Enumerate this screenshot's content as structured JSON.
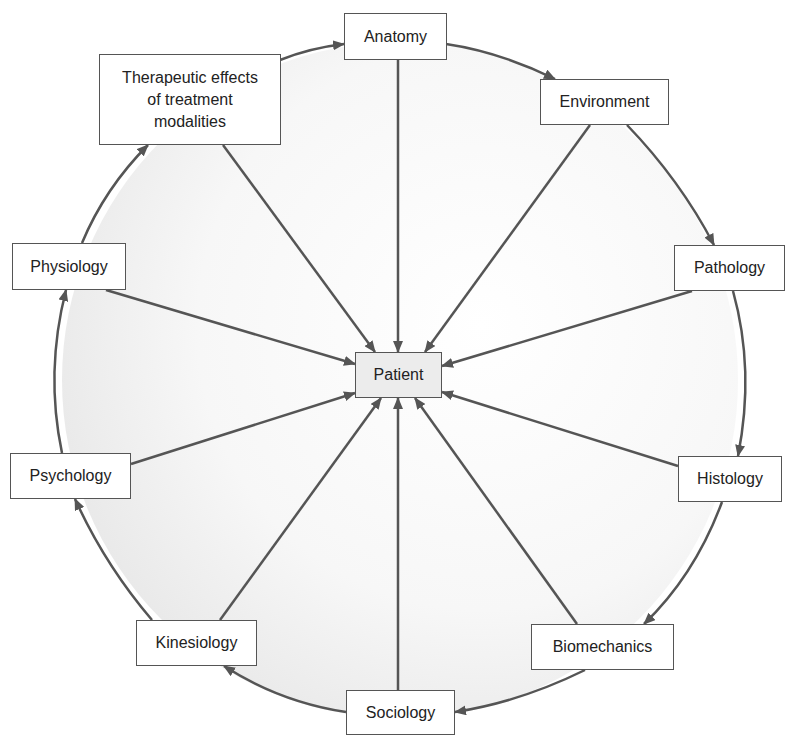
{
  "diagram": {
    "center": {
      "label": "Patient",
      "x": 355,
      "y": 352,
      "w": 87,
      "h": 46
    },
    "nodes": [
      {
        "id": "anatomy",
        "label": "Anatomy",
        "x": 344,
        "y": 13,
        "w": 103,
        "h": 47
      },
      {
        "id": "environment",
        "label": "Environment",
        "x": 540,
        "y": 79,
        "w": 129,
        "h": 46
      },
      {
        "id": "pathology",
        "label": "Pathology",
        "x": 674,
        "y": 245,
        "w": 111,
        "h": 46
      },
      {
        "id": "histology",
        "label": "Histology",
        "x": 678,
        "y": 456,
        "w": 104,
        "h": 46
      },
      {
        "id": "biomechanics",
        "label": "Biomechanics",
        "x": 531,
        "y": 624,
        "w": 143,
        "h": 46
      },
      {
        "id": "sociology",
        "label": "Sociology",
        "x": 346,
        "y": 690,
        "w": 109,
        "h": 45
      },
      {
        "id": "kinesiology",
        "label": "Kinesiology",
        "x": 136,
        "y": 620,
        "w": 121,
        "h": 46
      },
      {
        "id": "psychology",
        "label": "Psychology",
        "x": 10,
        "y": 453,
        "w": 121,
        "h": 46
      },
      {
        "id": "physiology",
        "label": "Physiology",
        "x": 12,
        "y": 243,
        "w": 114,
        "h": 47
      },
      {
        "id": "therapeutic",
        "label": "Therapeutic effects\nof treatment\nmodalities",
        "x": 99,
        "y": 54,
        "w": 182,
        "h": 91
      }
    ],
    "spokes": [
      {
        "from": [
          398,
          60
        ],
        "to": [
          398,
          352
        ]
      },
      {
        "from": [
          590,
          125
        ],
        "to": [
          425,
          352
        ]
      },
      {
        "from": [
          692,
          291
        ],
        "to": [
          442,
          366
        ]
      },
      {
        "from": [
          678,
          466
        ],
        "to": [
          442,
          392
        ]
      },
      {
        "from": [
          577,
          624
        ],
        "to": [
          415,
          398
        ]
      },
      {
        "from": [
          398,
          690
        ],
        "to": [
          398,
          398
        ]
      },
      {
        "from": [
          220,
          620
        ],
        "to": [
          381,
          398
        ]
      },
      {
        "from": [
          131,
          464
        ],
        "to": [
          355,
          393
        ]
      },
      {
        "from": [
          106,
          290
        ],
        "to": [
          355,
          364
        ]
      },
      {
        "from": [
          223,
          145
        ],
        "to": [
          375,
          352
        ]
      }
    ],
    "ring_arrows": [
      {
        "from": [
          280,
          60
        ],
        "to": [
          344,
          44
        ],
        "ctrl": [
          310,
          48
        ]
      },
      {
        "from": [
          446,
          44
        ],
        "to": [
          555,
          79
        ],
        "ctrl": [
          500,
          52
        ]
      },
      {
        "from": [
          627,
          125
        ],
        "to": [
          714,
          245
        ],
        "ctrl": [
          680,
          180
        ]
      },
      {
        "from": [
          733,
          291
        ],
        "to": [
          738,
          456
        ],
        "ctrl": [
          755,
          370
        ]
      },
      {
        "from": [
          722,
          502
        ],
        "to": [
          644,
          624
        ],
        "ctrl": [
          695,
          575
        ]
      },
      {
        "from": [
          585,
          670
        ],
        "to": [
          455,
          712
        ],
        "ctrl": [
          520,
          702
        ]
      },
      {
        "from": [
          346,
          712
        ],
        "to": [
          224,
          666
        ],
        "ctrl": [
          280,
          702
        ]
      },
      {
        "from": [
          152,
          620
        ],
        "to": [
          75,
          499
        ],
        "ctrl": [
          105,
          565
        ]
      },
      {
        "from": [
          62,
          453
        ],
        "to": [
          66,
          290
        ],
        "ctrl": [
          45,
          372
        ]
      },
      {
        "from": [
          82,
          243
        ],
        "to": [
          148,
          145
        ],
        "ctrl": [
          105,
          188
        ]
      }
    ],
    "circle": {
      "cx": 400,
      "cy": 380,
      "r": 338
    },
    "colors": {
      "line": "#555555",
      "ring_fill": "#eeeeee",
      "ring_fill_light": "#ffffff",
      "center_fill": "#ececec",
      "text": "#222222"
    }
  }
}
